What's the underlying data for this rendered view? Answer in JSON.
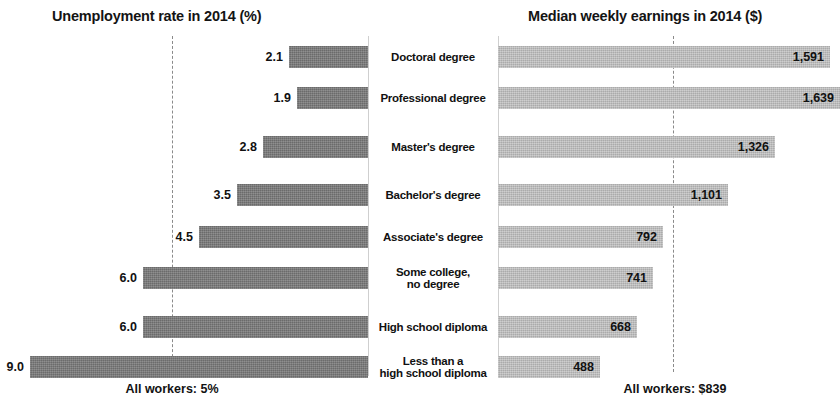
{
  "left_panel": {
    "title": "Unemployment rate in 2014 (%)",
    "footnote": "All workers: 5%"
  },
  "right_panel": {
    "title": "Median weekly earnings in 2014 ($)",
    "footnote": "All workers: $839"
  },
  "categories": [
    "Doctoral degree",
    "Professional degree",
    "Master's degree",
    "Bachelor's degree",
    "Associate's degree",
    "Some college,\nno degree",
    "High school diploma",
    "Less than a\nhigh school diploma"
  ],
  "unemployment_labels": [
    "2.1",
    "1.9",
    "2.8",
    "3.5",
    "4.5",
    "6.0",
    "6.0",
    "9.0"
  ],
  "earnings_labels": [
    "1,591",
    "1,639",
    "1,326",
    "1,101",
    "792",
    "741",
    "668",
    "488"
  ],
  "colors": {
    "unemployment_bar": "#767676",
    "earnings_bar": "#bcbcbc",
    "reference_line": "#8a8a8a",
    "text": "#111111",
    "background": "#ffffff"
  },
  "chart_data": {
    "type": "bar",
    "orientation": "horizontal",
    "layout": "back-to-back paired panels sharing centered category labels",
    "grid": false,
    "legend": null,
    "categories": [
      "Doctoral degree",
      "Professional degree",
      "Master's degree",
      "Bachelor's degree",
      "Associate's degree",
      "Some college, no degree",
      "High school diploma",
      "Less than a high school diploma"
    ],
    "series": [
      {
        "name": "Unemployment rate in 2014 (%)",
        "panel": "left",
        "direction": "right-to-left",
        "unit": "%",
        "values": [
          2.1,
          1.9,
          2.8,
          3.5,
          4.5,
          6.0,
          6.0,
          9.0
        ],
        "data_labels": [
          "2.1",
          "1.9",
          "2.8",
          "3.5",
          "4.5",
          "6.0",
          "6.0",
          "9.0"
        ],
        "xlim": [
          0,
          9.0
        ],
        "reference_line": {
          "label": "All workers: 5%",
          "value": 5.0
        },
        "color": "#767676"
      },
      {
        "name": "Median weekly earnings in 2014 ($)",
        "panel": "right",
        "direction": "left-to-right",
        "unit": "$",
        "values": [
          1591,
          1639,
          1326,
          1101,
          792,
          741,
          668,
          488
        ],
        "data_labels": [
          "1,591",
          "1,639",
          "1,326",
          "1,101",
          "792",
          "741",
          "668",
          "488"
        ],
        "xlim": [
          0,
          1639
        ],
        "reference_line": {
          "label": "All workers: $839",
          "value": 839
        },
        "color": "#bcbcbc"
      }
    ],
    "xlabel": "",
    "ylabel": ""
  }
}
